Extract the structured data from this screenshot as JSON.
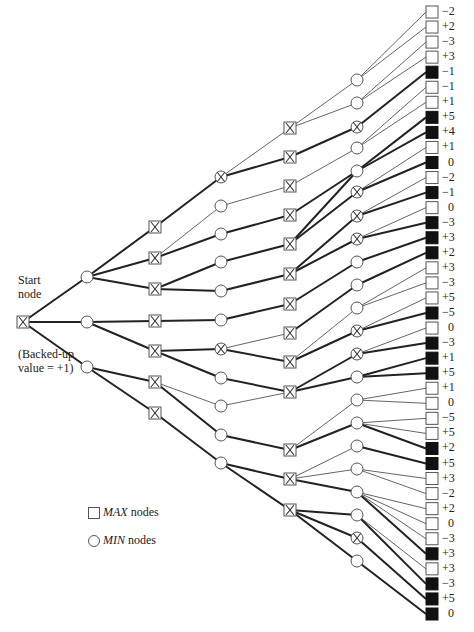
{
  "labels": {
    "start_line1": "Start",
    "start_line2": "node",
    "backed_line1": "(Backed-up",
    "backed_line2": "value = +1)"
  },
  "legend": {
    "max_italic": "MAX",
    "max_rest": " nodes",
    "min_italic": "MIN",
    "min_rest": " nodes"
  },
  "colors": {
    "line": "#222222",
    "node_fill": "#ffffff",
    "node_stroke": "#555555",
    "leaf_filled": "#111111"
  },
  "leaves": [
    {
      "v": "−2",
      "filled": false
    },
    {
      "v": "+2",
      "filled": false
    },
    {
      "v": "−3",
      "filled": false
    },
    {
      "v": "+3",
      "filled": false
    },
    {
      "v": "−1",
      "filled": true
    },
    {
      "v": "−1",
      "filled": false
    },
    {
      "v": "+1",
      "filled": false
    },
    {
      "v": "+5",
      "filled": true
    },
    {
      "v": "+4",
      "filled": true
    },
    {
      "v": "+1",
      "filled": false
    },
    {
      "v": "0",
      "filled": true
    },
    {
      "v": "−2",
      "filled": false
    },
    {
      "v": "−1",
      "filled": true
    },
    {
      "v": "0",
      "filled": false
    },
    {
      "v": "−3",
      "filled": true
    },
    {
      "v": "+3",
      "filled": true
    },
    {
      "v": "+2",
      "filled": true
    },
    {
      "v": "+3",
      "filled": false
    },
    {
      "v": "−3",
      "filled": false
    },
    {
      "v": "+5",
      "filled": false
    },
    {
      "v": "−5",
      "filled": true
    },
    {
      "v": "0",
      "filled": false
    },
    {
      "v": "−3",
      "filled": true
    },
    {
      "v": "+1",
      "filled": true
    },
    {
      "v": "+5",
      "filled": true
    },
    {
      "v": "+1",
      "filled": false
    },
    {
      "v": "0",
      "filled": false
    },
    {
      "v": "−5",
      "filled": false
    },
    {
      "v": "+5",
      "filled": false
    },
    {
      "v": "+2",
      "filled": true
    },
    {
      "v": "+5",
      "filled": true
    },
    {
      "v": "+3",
      "filled": false
    },
    {
      "v": "−2",
      "filled": false
    },
    {
      "v": "+2",
      "filled": false
    },
    {
      "v": "0",
      "filled": false
    },
    {
      "v": "−3",
      "filled": false
    },
    {
      "v": "+3",
      "filled": true
    },
    {
      "v": "+3",
      "filled": false
    },
    {
      "v": "−3",
      "filled": true
    },
    {
      "v": "+5",
      "filled": true
    },
    {
      "v": "0",
      "filled": true
    }
  ],
  "nodes": [
    {
      "id": "root",
      "type": "max",
      "x": 23,
      "y": 322
    },
    {
      "id": "a1",
      "type": "min",
      "x": 87,
      "y": 277
    },
    {
      "id": "a2",
      "type": "min",
      "x": 87,
      "y": 322
    },
    {
      "id": "a3",
      "type": "min",
      "x": 87,
      "y": 367
    },
    {
      "id": "b1",
      "type": "max",
      "x": 155,
      "y": 227
    },
    {
      "id": "b2",
      "type": "maxx",
      "x": 155,
      "y": 258
    },
    {
      "id": "b3",
      "type": "max",
      "x": 155,
      "y": 289
    },
    {
      "id": "b4",
      "type": "max",
      "x": 155,
      "y": 321
    },
    {
      "id": "b5",
      "type": "max",
      "x": 155,
      "y": 351
    },
    {
      "id": "b6",
      "type": "maxx",
      "x": 155,
      "y": 382
    },
    {
      "id": "b7",
      "type": "max",
      "x": 155,
      "y": 413
    },
    {
      "id": "c1",
      "type": "minx",
      "x": 221,
      "y": 177
    },
    {
      "id": "c2",
      "type": "min",
      "x": 221,
      "y": 206
    },
    {
      "id": "c3",
      "type": "min",
      "x": 221,
      "y": 234
    },
    {
      "id": "c4",
      "type": "min",
      "x": 221,
      "y": 262
    },
    {
      "id": "c5",
      "type": "min",
      "x": 221,
      "y": 291
    },
    {
      "id": "c6",
      "type": "min",
      "x": 221,
      "y": 320
    },
    {
      "id": "c7",
      "type": "minx",
      "x": 221,
      "y": 349
    },
    {
      "id": "c8",
      "type": "min",
      "x": 221,
      "y": 378
    },
    {
      "id": "c9",
      "type": "min",
      "x": 221,
      "y": 406
    },
    {
      "id": "c10",
      "type": "min",
      "x": 221,
      "y": 435
    },
    {
      "id": "c11",
      "type": "min",
      "x": 221,
      "y": 463
    },
    {
      "id": "d1",
      "type": "max",
      "x": 290,
      "y": 128
    },
    {
      "id": "d2",
      "type": "max",
      "x": 290,
      "y": 157
    },
    {
      "id": "d3",
      "type": "max",
      "x": 290,
      "y": 186
    },
    {
      "id": "d4",
      "type": "max",
      "x": 290,
      "y": 215
    },
    {
      "id": "d5",
      "type": "max",
      "x": 290,
      "y": 244
    },
    {
      "id": "d6",
      "type": "max",
      "x": 290,
      "y": 274
    },
    {
      "id": "d7",
      "type": "max",
      "x": 290,
      "y": 304
    },
    {
      "id": "d8",
      "type": "max",
      "x": 290,
      "y": 333
    },
    {
      "id": "d9",
      "type": "max",
      "x": 290,
      "y": 362
    },
    {
      "id": "d10",
      "type": "max",
      "x": 290,
      "y": 392
    },
    {
      "id": "d11",
      "type": "maxx",
      "x": 290,
      "y": 450
    },
    {
      "id": "d12",
      "type": "maxx",
      "x": 290,
      "y": 479
    },
    {
      "id": "d13",
      "type": "max",
      "x": 290,
      "y": 510
    },
    {
      "id": "e1",
      "type": "min",
      "x": 357,
      "y": 80
    },
    {
      "id": "e2",
      "type": "min",
      "x": 357,
      "y": 103
    },
    {
      "id": "e3",
      "type": "minx",
      "x": 357,
      "y": 127
    },
    {
      "id": "e4",
      "type": "min",
      "x": 357,
      "y": 148
    },
    {
      "id": "e5",
      "type": "min",
      "x": 357,
      "y": 171
    },
    {
      "id": "e6",
      "type": "minx",
      "x": 357,
      "y": 192
    },
    {
      "id": "e7",
      "type": "minx",
      "x": 357,
      "y": 216
    },
    {
      "id": "e8",
      "type": "minx",
      "x": 357,
      "y": 239
    },
    {
      "id": "e9",
      "type": "min",
      "x": 357,
      "y": 262
    },
    {
      "id": "e10",
      "type": "min",
      "x": 357,
      "y": 285
    },
    {
      "id": "e11",
      "type": "min",
      "x": 357,
      "y": 308
    },
    {
      "id": "e12",
      "type": "minx",
      "x": 357,
      "y": 331
    },
    {
      "id": "e13",
      "type": "minx",
      "x": 357,
      "y": 354
    },
    {
      "id": "e14",
      "type": "min",
      "x": 357,
      "y": 377
    },
    {
      "id": "e15",
      "type": "min",
      "x": 357,
      "y": 400
    },
    {
      "id": "e16",
      "type": "min",
      "x": 357,
      "y": 423
    },
    {
      "id": "e17",
      "type": "min",
      "x": 357,
      "y": 446
    },
    {
      "id": "e18",
      "type": "min",
      "x": 357,
      "y": 469
    },
    {
      "id": "e19",
      "type": "min",
      "x": 357,
      "y": 492
    },
    {
      "id": "e20",
      "type": "min",
      "x": 357,
      "y": 515
    },
    {
      "id": "e21",
      "type": "minx",
      "x": 357,
      "y": 538
    },
    {
      "id": "e22",
      "type": "min",
      "x": 357,
      "y": 561
    }
  ],
  "edges": [
    [
      "root",
      "a1",
      1
    ],
    [
      "root",
      "a2",
      1
    ],
    [
      "root",
      "a3",
      1
    ],
    [
      "a1",
      "b1",
      1
    ],
    [
      "a1",
      "b2",
      1
    ],
    [
      "a1",
      "b3",
      1
    ],
    [
      "a2",
      "b4",
      1
    ],
    [
      "a2",
      "b5",
      1
    ],
    [
      "a3",
      "b6",
      1
    ],
    [
      "a3",
      "b7",
      1
    ],
    [
      "b1",
      "c1",
      1
    ],
    [
      "b2",
      "c2",
      0
    ],
    [
      "b2",
      "c3",
      1
    ],
    [
      "b3",
      "c4",
      1
    ],
    [
      "b3",
      "c5",
      1
    ],
    [
      "b4",
      "c6",
      1
    ],
    [
      "b5",
      "c7",
      1
    ],
    [
      "b5",
      "c8",
      1
    ],
    [
      "b6",
      "c9",
      0
    ],
    [
      "b6",
      "c10",
      1
    ],
    [
      "b7",
      "c11",
      1
    ],
    [
      "c1",
      "d1",
      0
    ],
    [
      "c1",
      "d2",
      1
    ],
    [
      "c2",
      "d3",
      0
    ],
    [
      "c3",
      "d4",
      1
    ],
    [
      "c4",
      "d5",
      1
    ],
    [
      "c5",
      "d6",
      1
    ],
    [
      "c6",
      "d7",
      1
    ],
    [
      "c7",
      "d8",
      0
    ],
    [
      "c7",
      "d9",
      1
    ],
    [
      "c8",
      "d10",
      1
    ],
    [
      "c9",
      "d10",
      0
    ],
    [
      "c10",
      "d11",
      1
    ],
    [
      "c11",
      "d12",
      1
    ],
    [
      "c11",
      "d13",
      1
    ],
    [
      "d1",
      "e1",
      0
    ],
    [
      "d1",
      "e2",
      0
    ],
    [
      "d2",
      "e3",
      1
    ],
    [
      "d3",
      "e4",
      0
    ],
    [
      "d4",
      "e5",
      1
    ],
    [
      "d5",
      "e5",
      1
    ],
    [
      "d5",
      "e6",
      1
    ],
    [
      "d6",
      "e7",
      1
    ],
    [
      "d6",
      "e8",
      1
    ],
    [
      "d7",
      "e9",
      1
    ],
    [
      "d8",
      "e10",
      1
    ],
    [
      "d9",
      "e11",
      0
    ],
    [
      "d9",
      "e12",
      1
    ],
    [
      "d10",
      "e13",
      1
    ],
    [
      "d10",
      "e14",
      1
    ],
    [
      "d11",
      "e15",
      0
    ],
    [
      "d11",
      "e16",
      1
    ],
    [
      "d12",
      "e17",
      0
    ],
    [
      "d12",
      "e18",
      0
    ],
    [
      "d12",
      "e19",
      1
    ],
    [
      "d13",
      "e20",
      1
    ],
    [
      "d13",
      "e21",
      1
    ],
    [
      "d13",
      "e22",
      1
    ],
    [
      "e1",
      "L0",
      0
    ],
    [
      "e1",
      "L1",
      0
    ],
    [
      "e2",
      "L2",
      0
    ],
    [
      "e2",
      "L3",
      0
    ],
    [
      "e3",
      "L4",
      1
    ],
    [
      "e4",
      "L5",
      0
    ],
    [
      "e4",
      "L6",
      0
    ],
    [
      "e5",
      "L7",
      1
    ],
    [
      "e5",
      "L8",
      1
    ],
    [
      "e6",
      "L9",
      0
    ],
    [
      "e6",
      "L10",
      1
    ],
    [
      "e7",
      "L11",
      0
    ],
    [
      "e7",
      "L12",
      1
    ],
    [
      "e8",
      "L13",
      0
    ],
    [
      "e8",
      "L14",
      1
    ],
    [
      "e9",
      "L15",
      1
    ],
    [
      "e10",
      "L16",
      1
    ],
    [
      "e11",
      "L17",
      0
    ],
    [
      "e11",
      "L18",
      0
    ],
    [
      "e12",
      "L19",
      0
    ],
    [
      "e12",
      "L20",
      1
    ],
    [
      "e13",
      "L21",
      0
    ],
    [
      "e13",
      "L22",
      1
    ],
    [
      "e14",
      "L23",
      1
    ],
    [
      "e14",
      "L24",
      1
    ],
    [
      "e15",
      "L25",
      0
    ],
    [
      "e15",
      "L26",
      0
    ],
    [
      "e16",
      "L27",
      0
    ],
    [
      "e16",
      "L28",
      0
    ],
    [
      "e16",
      "L29",
      1
    ],
    [
      "e17",
      "L30",
      1
    ],
    [
      "e18",
      "L31",
      0
    ],
    [
      "e18",
      "L32",
      0
    ],
    [
      "e19",
      "L33",
      0
    ],
    [
      "e19",
      "L34",
      0
    ],
    [
      "e19",
      "L35",
      0
    ],
    [
      "e19",
      "L36",
      1
    ],
    [
      "e20",
      "L37",
      0
    ],
    [
      "e20",
      "L38",
      1
    ],
    [
      "e21",
      "L39",
      1
    ],
    [
      "e22",
      "L40",
      1
    ]
  ]
}
